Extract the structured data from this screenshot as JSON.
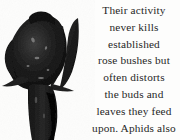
{
  "page": {
    "background_color": "#fdfdfc",
    "width": 180,
    "height": 140
  },
  "photo": {
    "subject": "rose-bud-with-leaves",
    "description": "Dark high-contrast photograph of a rose bud on a stem with pointed leaves",
    "ink_color": "#0d0d0d",
    "mid_color": "#2b2b2b",
    "highlight_color": "#5a5a5a"
  },
  "caption": {
    "text_color": "#272727",
    "alignment": "center",
    "lines": [
      "Their activity",
      "never kills",
      "established",
      "rose bushes but",
      "often distorts",
      "the buds and",
      "leaves they feed",
      "upon. Aphids also",
      "excrete honeydew,"
    ],
    "full_text": "Their activity never kills established rose bushes but often distorts the buds and leaves they feed upon. Aphids also excrete honeydew,"
  }
}
